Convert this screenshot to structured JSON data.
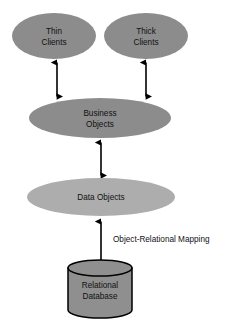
{
  "diagram": {
    "background_color": "#ffffff",
    "colors": {
      "node_fill_dark": "#8c8c8c",
      "node_fill_light": "#adadad",
      "cylinder_fill": "#8f8f8f",
      "stroke": "#000000",
      "text": "#111111"
    },
    "nodes": [
      {
        "id": "thin-clients",
        "shape": "ellipse",
        "lines": [
          "Thin",
          "Clients"
        ],
        "fill": "#8c8c8c",
        "cx": 54,
        "cy": 36,
        "rx": 42,
        "ry": 23
      },
      {
        "id": "thick-clients",
        "shape": "ellipse",
        "lines": [
          "Thick",
          "Clients"
        ],
        "fill": "#8c8c8c",
        "cx": 146,
        "cy": 36,
        "rx": 42,
        "ry": 23
      },
      {
        "id": "business-objects",
        "shape": "ellipse",
        "lines": [
          "Business",
          "Objects"
        ],
        "fill": "#8c8c8c",
        "cx": 100,
        "cy": 118,
        "rx": 71,
        "ry": 20
      },
      {
        "id": "data-objects",
        "shape": "ellipse",
        "lines": [
          "Data Objects"
        ],
        "fill": "#adadad",
        "cx": 101,
        "cy": 197,
        "rx": 74,
        "ry": 19
      },
      {
        "id": "relational-database",
        "shape": "cylinder",
        "lines": [
          "Relational",
          "Database"
        ],
        "fill": "#8f8f8f",
        "cx": 100,
        "top": 268,
        "bottom": 318,
        "rx": 32,
        "ry": 8
      }
    ],
    "edges": [
      {
        "id": "thin-to-business",
        "from": "thin-clients",
        "to": "business-objects",
        "arrowheads": "both",
        "x": 57,
        "y1": 59,
        "y2": 100
      },
      {
        "id": "thick-to-business",
        "from": "thick-clients",
        "to": "business-objects",
        "arrowheads": "both",
        "x": 146,
        "y1": 59,
        "y2": 100
      },
      {
        "id": "business-to-data",
        "from": "business-objects",
        "to": "data-objects",
        "arrowheads": "both",
        "x": 101,
        "y1": 139,
        "y2": 179
      },
      {
        "id": "data-to-database",
        "from": "data-objects",
        "to": "relational-database",
        "arrowheads": "both",
        "label": "Object-Relational Mapping",
        "label_x": 114,
        "label_y": 240,
        "x": 101,
        "y1": 218,
        "y2": 266
      }
    ]
  }
}
